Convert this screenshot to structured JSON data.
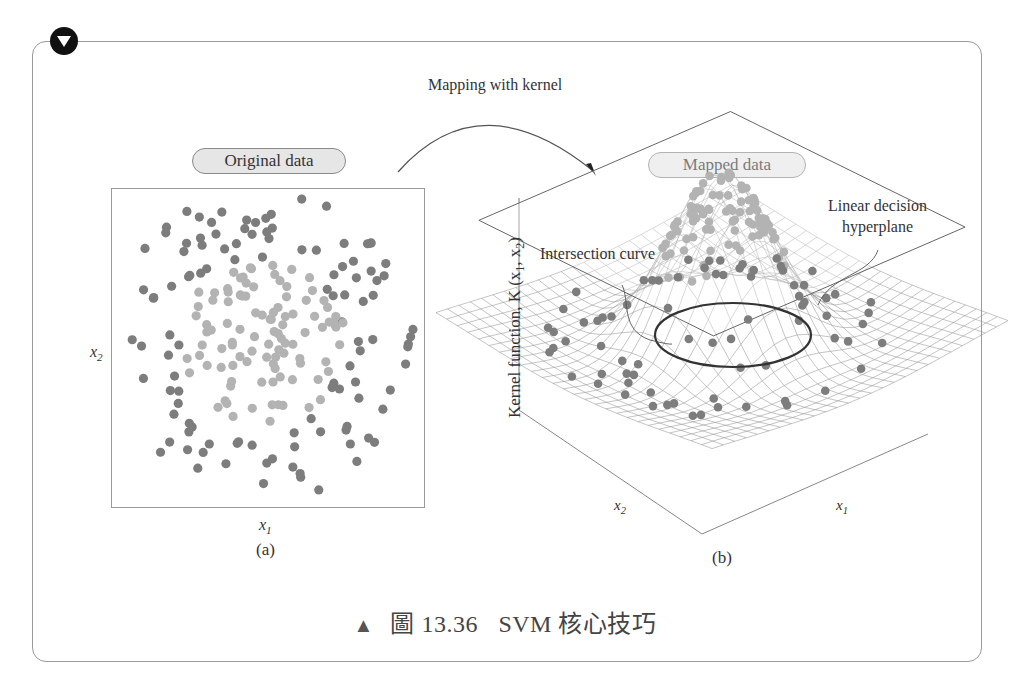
{
  "figure": {
    "badge_icon": "triangle-down-icon",
    "mapping_label": "Mapping with kernel",
    "panel_a": {
      "title": "Original data",
      "xlabel": "x",
      "xlabel_sub": "1",
      "ylabel": "x",
      "ylabel_sub": "2",
      "sublabel": "(a)"
    },
    "panel_b": {
      "title": "Mapped data",
      "zlabel": "Kernel function, K (x",
      "zlabel_sub1": "1",
      "zlabel_mid": ", x",
      "zlabel_sub2": "2",
      "zlabel_end": ")",
      "x1_label": "x",
      "x1_sub": "1",
      "x2_label": "x",
      "x2_sub": "2",
      "annotation_intersection": "Intersection curve",
      "annotation_hyperplane_line1": "Linear decision",
      "annotation_hyperplane_line2": "hyperplane",
      "sublabel": "(b)"
    },
    "caption": {
      "marker": "▲",
      "figure_number": "圖 13.36",
      "title": "SVM 核心技巧"
    },
    "colors": {
      "outer_class": "#7d7d7d",
      "inner_class": "#b3b3b3",
      "border": "#9a9a9a",
      "pill_fill": "#e6e6e6",
      "caption_marker": "#666666"
    }
  },
  "chart_data": [
    {
      "type": "scatter",
      "title": "Original data",
      "xlabel": "x1",
      "ylabel": "x2",
      "grid": false,
      "legend": "none",
      "series": [
        {
          "name": "outer class (dark)",
          "description": "ring of points surrounding the center",
          "approx_count": 110
        },
        {
          "name": "inner class (light)",
          "description": "cluster of points near the center",
          "approx_count": 95
        }
      ]
    },
    {
      "type": "surface",
      "title": "Mapped data",
      "xlabel": "x1",
      "ylabel": "x2",
      "zlabel": "Kernel function, K(x1, x2)",
      "description": "Gaussian-shaped kernel surface; light points lie on the peak, dark points on the low skirt; a horizontal linear decision hyperplane cuts the peak producing an elliptical intersection curve",
      "annotations": [
        "Intersection curve",
        "Linear decision hyperplane"
      ]
    }
  ]
}
